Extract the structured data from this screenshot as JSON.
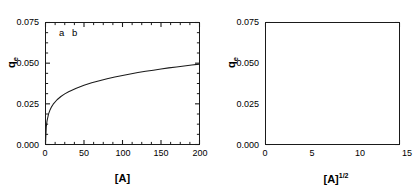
{
  "figure": {
    "background": "#ffffff",
    "line_color": "#1a1a1a",
    "axis_color": "#1a1a1a"
  },
  "panels": [
    {
      "key": "a",
      "label": "a",
      "xlabel_base": "[A]",
      "xlabel_exponent": "",
      "ylabel_base": "q",
      "ylabel_sub": "e",
      "ytick_labels": [
        "0.075",
        "0.050",
        "0.025",
        "0.000"
      ],
      "xtick_labels": [
        "0",
        "50",
        "100",
        "150",
        "200"
      ]
    },
    {
      "key": "b",
      "label": "b",
      "xlabel_base": "[A]",
      "xlabel_exponent": "1/2",
      "ylabel_base": "q",
      "ylabel_sub": "e",
      "ytick_labels": [
        "0.075",
        "0.050",
        "0.025",
        "0.000"
      ],
      "xtick_labels": [
        "0",
        "5",
        "10",
        "15"
      ]
    }
  ],
  "chart_data": [
    {
      "type": "line",
      "panel": "a",
      "title": "",
      "xlabel": "[A]",
      "ylabel": "q_e",
      "xlim": [
        0,
        200
      ],
      "ylim": [
        0.0,
        0.075
      ],
      "xticks": [
        0,
        50,
        100,
        150,
        200
      ],
      "yticks": [
        0.0,
        0.025,
        0.05,
        0.075
      ],
      "xminor_interval": 12.5,
      "yminor_interval": 0.00625,
      "grid": false,
      "legend": "none",
      "annotations": [
        "a"
      ],
      "series": [
        {
          "name": "q_e vs [A]",
          "x": [
            0,
            1,
            2,
            4,
            6,
            8,
            10,
            15,
            20,
            25,
            30,
            40,
            50,
            60,
            70,
            80,
            90,
            100,
            110,
            120,
            130,
            140,
            150,
            160,
            170,
            180,
            190,
            200
          ],
          "y": [
            0.0,
            0.0108,
            0.0145,
            0.0188,
            0.0214,
            0.0233,
            0.0248,
            0.0275,
            0.0295,
            0.0311,
            0.0324,
            0.0346,
            0.0364,
            0.0379,
            0.0392,
            0.0404,
            0.0415,
            0.0424,
            0.0433,
            0.0442,
            0.045,
            0.0457,
            0.0464,
            0.0471,
            0.0477,
            0.0483,
            0.0489,
            0.0494
          ]
        }
      ]
    },
    {
      "type": "line",
      "panel": "b",
      "title": "",
      "xlabel": "[A]^1/2",
      "ylabel": "q_e",
      "xlim": [
        0,
        15
      ],
      "ylim": [
        0.0,
        0.075
      ],
      "xticks": [
        0,
        5,
        10,
        15
      ],
      "yticks": [
        0.0,
        0.025,
        0.05,
        0.075
      ],
      "xminor_interval": 2.5,
      "yminor_interval": 0.00625,
      "grid": false,
      "legend": "none",
      "annotations": [
        "b"
      ],
      "series": [
        {
          "name": "q_e vs [A]^1/2",
          "x": [
            0,
            0.5,
            1.0,
            1.5,
            2.0,
            2.5,
            3.0,
            3.5,
            4.0,
            4.5,
            5.0,
            5.5,
            6.0,
            6.5,
            7.0,
            7.5,
            8.0,
            8.5,
            9.0,
            9.5,
            10.0,
            10.5,
            11.0,
            11.5,
            12.0,
            12.5,
            13.0,
            13.5,
            14.1
          ],
          "y": [
            0.0,
            0.0042,
            0.0082,
            0.012,
            0.0155,
            0.0188,
            0.0218,
            0.0245,
            0.027,
            0.0293,
            0.0314,
            0.0333,
            0.0351,
            0.0367,
            0.0382,
            0.0396,
            0.0409,
            0.0421,
            0.0432,
            0.0443,
            0.0453,
            0.0462,
            0.0471,
            0.0479,
            0.0487,
            0.0494,
            0.0501,
            0.0508,
            0.0516
          ]
        }
      ]
    }
  ]
}
